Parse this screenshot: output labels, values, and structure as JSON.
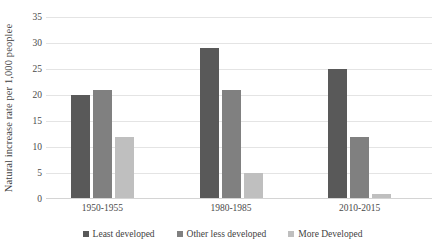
{
  "chart_data": {
    "type": "bar",
    "title": "",
    "subtitle": "",
    "xlabel": "",
    "ylabel": "Natural increase rate per 1,000 peoplee",
    "categories": [
      "1950-1955",
      "1980-1985",
      "2010-2015"
    ],
    "series": [
      {
        "name": "Least developed",
        "values": [
          20,
          29,
          25
        ],
        "color": "#595959"
      },
      {
        "name": "Other less developed",
        "values": [
          21,
          21,
          12
        ],
        "color": "#808080"
      },
      {
        "name": "More Developed",
        "values": [
          12,
          5,
          1
        ],
        "color": "#bfbfbf"
      }
    ],
    "ylim": [
      0,
      35
    ],
    "ytick_step": 5,
    "yticks": [
      35,
      30,
      25,
      20,
      15,
      10,
      5,
      0
    ],
    "grid": true,
    "grid_axis": "y",
    "grid_color": "#e4e4e4",
    "legend_position": "bottom",
    "background": "#ffffff"
  }
}
